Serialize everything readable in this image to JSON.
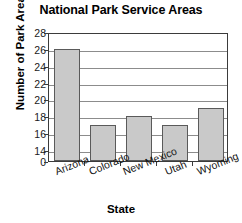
{
  "chart_data": {
    "type": "bar",
    "title": "National Park Service Areas",
    "xlabel": "State",
    "ylabel": "Number of Park Areas",
    "categories": [
      "Arizona",
      "Colorado",
      "New Mexico",
      "Utah",
      "Wyoming"
    ],
    "values": [
      26,
      17,
      18,
      17,
      19
    ],
    "series": [
      {
        "name": "Number of Park Areas",
        "values": [
          26,
          17,
          18,
          17,
          19
        ]
      }
    ],
    "ylim": [
      14,
      28
    ],
    "yticks": [
      0,
      14,
      16,
      18,
      20,
      22,
      24,
      26,
      28
    ],
    "ytick_labels": [
      "0",
      "14",
      "16",
      "18",
      "20",
      "22",
      "24",
      "26",
      "28"
    ],
    "axis_break": true,
    "axis_break_note": "y-axis jumps from 0 to 14",
    "grid": true,
    "grid_axis": "y",
    "legend": false,
    "legend_position": "none",
    "bar_color": "#c9c9c9",
    "bar_edge_color": "#5a5a5a",
    "grid_color": "#8c8c8c",
    "frame_color": "#3b3b3b",
    "background_color": "#ffffff",
    "xtick_label_rotation": -22
  }
}
